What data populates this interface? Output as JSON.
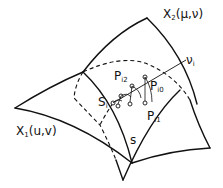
{
  "diagram": {
    "type": "intersecting parametric surfaces",
    "colors": {
      "stroke": "#111111",
      "background": "#ffffff"
    },
    "labels": {
      "surface1": {
        "base": "X",
        "sub": "1",
        "args": "(u,v)"
      },
      "surface2": {
        "base": "X",
        "sub": "2",
        "args": "(μ,ν)"
      },
      "curve_s": "s",
      "point_s": {
        "base": "S",
        "sub": "i"
      },
      "point_p0": {
        "base": "P",
        "sub": "i0"
      },
      "point_p1": {
        "base": "P",
        "sub": "i1"
      },
      "point_p2": {
        "base": "P",
        "sub": "i2"
      },
      "line_v": {
        "base": "ν",
        "sub": "i"
      }
    }
  }
}
